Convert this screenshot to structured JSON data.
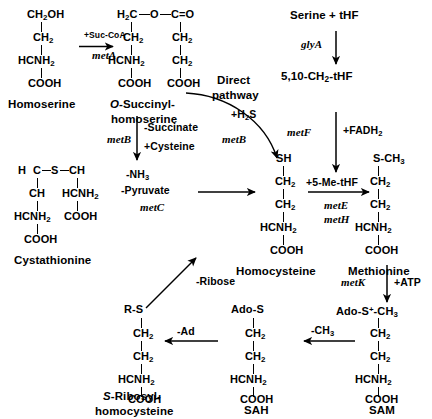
{
  "diagram": {
    "colors": {
      "ink": "#000000",
      "background": "#ffffff"
    }
  },
  "metabolites": {
    "homoserine": {
      "label": "Homoserine",
      "formula_lines": [
        "CH2OH",
        "CH2",
        "HCNH2",
        "COOH"
      ]
    },
    "o_succinylhomoserine": {
      "label_line1": "O-Succinyl-",
      "label_line2": "homoserine",
      "label_italic_prefix": "O",
      "backbone_left": [
        "H2C",
        "CH2",
        "HCNH2",
        "COOH"
      ],
      "backbone_right": [
        "C=O",
        "CH2",
        "CH2",
        "COOH"
      ],
      "ester_link": "O"
    },
    "cystathionine": {
      "label": "Cystathionine",
      "top_row": [
        "H",
        "C",
        "S",
        "CH"
      ],
      "left_chain": [
        "CH",
        "HCNH2",
        "COOH"
      ],
      "right_chain": [
        "HCNH2",
        "COOH"
      ]
    },
    "homocysteine": {
      "label": "Homocysteine",
      "formula_lines": [
        "SH",
        "CH2",
        "CH2",
        "HCNH2",
        "COOH"
      ]
    },
    "methionine": {
      "label": "Methionine",
      "formula_lines": [
        "S-CH3",
        "CH2",
        "CH2",
        "HCNH2",
        "COOH"
      ]
    },
    "sam": {
      "label": "SAM",
      "formula_lines": [
        "Ado-S-CH3",
        "CH2",
        "CH2",
        "HCNH2",
        "COOH"
      ],
      "charge": "+"
    },
    "sah": {
      "label": "SAH",
      "formula_lines": [
        "Ado-S",
        "CH2",
        "CH2",
        "HCNH2",
        "COOH"
      ]
    },
    "s_ribosyl_homocysteine": {
      "label_line1": "S-Ribosyl-",
      "label_line2": "homocysteine",
      "label_italic_prefix": "S",
      "formula_lines": [
        "R-S",
        "CH2",
        "CH2",
        "HCNH2",
        "COOH"
      ]
    },
    "serine_thf": {
      "label": "Serine + tHF"
    },
    "methylene_thf": {
      "label": "5,10-CH2-tHF"
    }
  },
  "reactions": {
    "homoserine_to_osuccinyl": {
      "cofactor": "+Suc-CoA",
      "gene": "metA"
    },
    "osuccinyl_to_cystathionine": {
      "cofactor_line1": "-Succinate",
      "cofactor_line2": "+Cysteine",
      "gene": "metB"
    },
    "cystathionine_to_homocysteine": {
      "cofactor_line1": "-NH3",
      "cofactor_line2": "-Pyruvate",
      "gene": "metC"
    },
    "direct_pathway": {
      "label_line1": "Direct",
      "label_line2": "pathway",
      "cofactor": "+H2S",
      "gene": "metB"
    },
    "serine_to_methylene_thf": {
      "gene": "glyA"
    },
    "methylene_thf_to_5me_thf": {
      "gene": "metF",
      "cofactor": "+FADH2"
    },
    "homocysteine_to_methionine": {
      "cofactor": "+5-Me-tHF",
      "gene_line1": "metE",
      "gene_line2": "metH"
    },
    "methionine_to_sam": {
      "gene": "metK",
      "cofactor": "+ATP"
    },
    "sam_to_sah": {
      "cofactor": "-CH3"
    },
    "sah_to_sribosyl": {
      "cofactor": "-Ad"
    },
    "sribosyl_to_homocysteine": {
      "cofactor": "-Ribose"
    }
  }
}
